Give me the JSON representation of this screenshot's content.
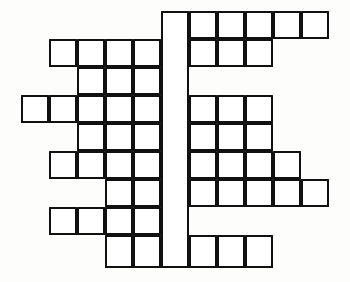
{
  "puzzle": {
    "title": "Crossword Puzzle Grid",
    "kind": "blank-crossword-grid",
    "description": "Empty crossword puzzle grid outline with no letters, numbers or clues printed",
    "canvas": {
      "width": 350,
      "height": 282
    },
    "style": {
      "cell_size": 28,
      "line_width": 2.4,
      "line_color": "#111111",
      "cell_fill": "#ffffff",
      "page_background": "#fdfdfc"
    },
    "geometry": {
      "origin_x": 21,
      "origin_y": 11,
      "column_x": [
        21,
        49,
        77,
        105,
        133,
        161,
        189,
        217,
        245,
        273,
        301
      ],
      "row_y": [
        11,
        39,
        67,
        95,
        123,
        151,
        179,
        207,
        235
      ],
      "row_heights": [
        28,
        28,
        28,
        28,
        28,
        28,
        28,
        28,
        33
      ],
      "columns": 11,
      "rows": 9
    },
    "cells": [
      {
        "row": 0,
        "col": 6
      },
      {
        "row": 0,
        "col": 7
      },
      {
        "row": 0,
        "col": 8
      },
      {
        "row": 0,
        "col": 9
      },
      {
        "row": 0,
        "col": 10
      },
      {
        "row": 1,
        "col": 1
      },
      {
        "row": 1,
        "col": 2
      },
      {
        "row": 1,
        "col": 3
      },
      {
        "row": 1,
        "col": 4
      },
      {
        "row": 1,
        "col": 6
      },
      {
        "row": 1,
        "col": 7
      },
      {
        "row": 1,
        "col": 8
      },
      {
        "row": 2,
        "col": 2
      },
      {
        "row": 2,
        "col": 3
      },
      {
        "row": 2,
        "col": 4
      },
      {
        "row": 3,
        "col": 0
      },
      {
        "row": 3,
        "col": 1
      },
      {
        "row": 3,
        "col": 2
      },
      {
        "row": 3,
        "col": 3
      },
      {
        "row": 3,
        "col": 4
      },
      {
        "row": 3,
        "col": 6
      },
      {
        "row": 3,
        "col": 7
      },
      {
        "row": 3,
        "col": 8
      },
      {
        "row": 4,
        "col": 2
      },
      {
        "row": 4,
        "col": 3
      },
      {
        "row": 4,
        "col": 4
      },
      {
        "row": 4,
        "col": 6
      },
      {
        "row": 4,
        "col": 7
      },
      {
        "row": 4,
        "col": 8
      },
      {
        "row": 5,
        "col": 1
      },
      {
        "row": 5,
        "col": 2
      },
      {
        "row": 5,
        "col": 3
      },
      {
        "row": 5,
        "col": 4
      },
      {
        "row": 5,
        "col": 6
      },
      {
        "row": 5,
        "col": 7
      },
      {
        "row": 5,
        "col": 8
      },
      {
        "row": 5,
        "col": 9
      },
      {
        "row": 6,
        "col": 3
      },
      {
        "row": 6,
        "col": 4
      },
      {
        "row": 6,
        "col": 6
      },
      {
        "row": 6,
        "col": 7
      },
      {
        "row": 6,
        "col": 8
      },
      {
        "row": 6,
        "col": 9
      },
      {
        "row": 6,
        "col": 10
      },
      {
        "row": 7,
        "col": 1
      },
      {
        "row": 7,
        "col": 2
      },
      {
        "row": 7,
        "col": 3
      },
      {
        "row": 7,
        "col": 4
      },
      {
        "row": 8,
        "col": 3
      },
      {
        "row": 8,
        "col": 4
      },
      {
        "row": 8,
        "col": 6
      },
      {
        "row": 8,
        "col": 7
      },
      {
        "row": 8,
        "col": 8
      }
    ],
    "spine": {
      "label": "central vertical bar",
      "col": 5,
      "row_start": 0,
      "row_end": 8,
      "undivided": true
    }
  }
}
